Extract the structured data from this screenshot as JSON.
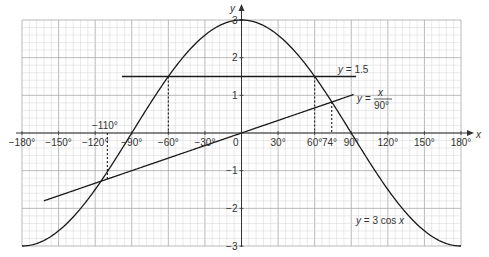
{
  "chart_data": {
    "type": "line",
    "title": "",
    "xlabel": "x",
    "ylabel": "y",
    "xlim": [
      -180,
      180
    ],
    "ylim": [
      -3,
      3
    ],
    "grid": true,
    "x_ticks": [
      -180,
      -150,
      -120,
      -90,
      -60,
      -30,
      0,
      30,
      60,
      90,
      120,
      150,
      180
    ],
    "x_tick_labels": [
      "−180°",
      "−150°",
      "−120°",
      "−90°",
      "−60°",
      "−30°",
      "0",
      "30°",
      "60°",
      "90°",
      "120°",
      "150°",
      "180°"
    ],
    "y_ticks": [
      -3,
      -2,
      -1,
      1,
      2,
      3
    ],
    "y_tick_labels": [
      "−3",
      "−2",
      "−1",
      "1",
      "2",
      "3"
    ],
    "series": [
      {
        "name": "y = 3 cos x",
        "function": "3*cos(x)",
        "x_range": [
          -180,
          180
        ]
      },
      {
        "name": "y = 1.5",
        "function": "1.5",
        "x_range": [
          -98,
          94
        ]
      },
      {
        "name": "y = x/90°",
        "function": "x/90",
        "x_range": [
          -162,
          92
        ]
      }
    ],
    "annotations": [
      {
        "text": "−110°",
        "x": -110,
        "type": "dotted-vertical",
        "from_y": -1.22,
        "to_y": 0,
        "label_position": "above-axis"
      },
      {
        "text": "−60°",
        "x": -60,
        "type": "dotted-vertical",
        "from_y": 1.5,
        "to_y": 0
      },
      {
        "text": "60°",
        "x": 60,
        "type": "dotted-vertical",
        "from_y": 1.5,
        "to_y": 0
      },
      {
        "text": "74°",
        "x": 74,
        "type": "dotted-vertical",
        "from_y": 0.82,
        "to_y": 0
      }
    ],
    "labels": {
      "line_label": "y = 1.5",
      "linear_label_prefix": "y =",
      "linear_label_num": "x",
      "linear_label_den": "90°",
      "cos_label": "y = 3 cos x",
      "x_axis": "x",
      "y_axis": "y",
      "origin": "0",
      "minus110": "−110°",
      "l74": "74°"
    }
  }
}
